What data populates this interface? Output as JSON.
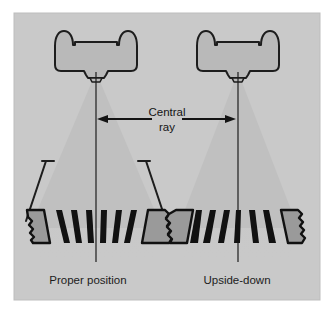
{
  "figure": {
    "kind": "radiographic-grid-alignment-diagram",
    "panel": {
      "background_color": "#c9c9c9",
      "border_color": "#b4b4b4",
      "outer_background_color": "#ffffff",
      "x": 14,
      "y": 13,
      "width": 306,
      "height": 287
    },
    "palette": {
      "beam_fill": "#c0c0c0",
      "beam_fill_lower": "#c5c5c5",
      "tube_fill": "#b9b9b9",
      "tube_stroke": "#1d1d1d",
      "strip_black": "#111111",
      "strip_gray": "#9a9a9a",
      "line_color": "#1c1c1c",
      "text_color": "#1c1c1c"
    },
    "annotation": {
      "label_line1": "Central",
      "label_line2": "ray",
      "arrow_style": "double-headed-horizontal",
      "arrow_y": 119,
      "arrow_x_left": 98,
      "arrow_x_right": 235
    },
    "panels": [
      {
        "id": "left",
        "caption": "Proper position",
        "caption_x": 88,
        "caption_y": 284,
        "central_ray_x": 96,
        "has_case_outline": true,
        "grid_orientation": "focused-aligned",
        "strip_direction": "diverging-outward",
        "tube": {
          "cx": 96,
          "cy": 55
        },
        "grid": {
          "cx": 96,
          "cy": 225,
          "half_width": 76
        },
        "strip_count": 7
      },
      {
        "id": "right",
        "caption": "Upside-down",
        "caption_x": 237,
        "caption_y": 284,
        "central_ray_x": 238,
        "has_case_outline": false,
        "grid_orientation": "inverted",
        "strip_direction": "converging-inward",
        "tube": {
          "cx": 238,
          "cy": 55
        },
        "grid": {
          "cx": 238,
          "cy": 225,
          "half_width": 70
        },
        "strip_count": 7
      }
    ]
  }
}
